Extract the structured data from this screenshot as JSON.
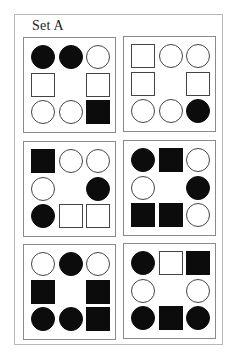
{
  "title": "Set A",
  "colors": {
    "filled": "#0c0c0c",
    "outline": "#444444",
    "panel_border": "#8a8a8a",
    "frame_border": "#b8b8b8"
  },
  "grid_layout": "3x3 ring (center cell empty), positions listed row-major skipping center",
  "panels": [
    {
      "id": 1,
      "cells": [
        [
          "circle-filled",
          "circle-filled",
          "circle-empty"
        ],
        [
          "square-empty",
          null,
          "square-empty"
        ],
        [
          "circle-empty",
          "circle-empty",
          "square-filled"
        ]
      ]
    },
    {
      "id": 2,
      "cells": [
        [
          "square-empty",
          "circle-empty",
          "circle-empty"
        ],
        [
          "square-empty",
          null,
          "square-empty"
        ],
        [
          "circle-empty",
          "circle-empty",
          "circle-filled"
        ]
      ]
    },
    {
      "id": 3,
      "cells": [
        [
          "square-filled",
          "circle-empty",
          "circle-empty"
        ],
        [
          "circle-empty",
          null,
          "circle-filled"
        ],
        [
          "circle-filled",
          "square-empty",
          "square-empty"
        ]
      ]
    },
    {
      "id": 4,
      "cells": [
        [
          "circle-filled",
          "square-filled",
          "circle-empty"
        ],
        [
          "circle-empty",
          null,
          "circle-filled"
        ],
        [
          "square-filled",
          "square-filled",
          "circle-empty"
        ]
      ]
    },
    {
      "id": 5,
      "cells": [
        [
          "circle-empty",
          "circle-filled",
          "circle-empty"
        ],
        [
          "square-filled",
          null,
          "square-filled"
        ],
        [
          "circle-filled",
          "circle-filled",
          "square-filled"
        ]
      ]
    },
    {
      "id": 6,
      "cells": [
        [
          "circle-filled",
          "square-empty",
          "square-filled"
        ],
        [
          "circle-empty",
          null,
          "circle-empty"
        ],
        [
          "circle-filled",
          "square-filled",
          "circle-filled"
        ]
      ]
    }
  ]
}
